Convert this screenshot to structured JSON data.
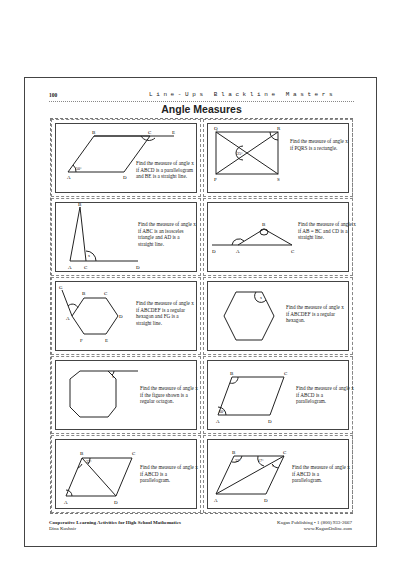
{
  "header": {
    "page_number": "100",
    "series_title": "Line-Ups Blackline Masters",
    "title": "Angle Measures"
  },
  "problems": [
    {
      "id": 1,
      "prompt": "Find the measure of angle x if ABCD is a parallelogram and BE is a straight line.",
      "labels": [
        "A",
        "B",
        "C",
        "D",
        "E"
      ],
      "given": "50°"
    },
    {
      "id": 2,
      "prompt": "Find the measure of angle x if PQRS is a rectangle.",
      "labels": [
        "P",
        "Q",
        "R",
        "S"
      ],
      "given": "25°"
    },
    {
      "id": 3,
      "prompt": "Find the measure of angle x if ABC is an isosceles triangle and AD is a straight line.",
      "labels": [
        "A",
        "B",
        "C",
        "D"
      ],
      "given": "x"
    },
    {
      "id": 4,
      "prompt": "Find the measure of angle x if AB = BC and CD is a straight line.",
      "labels": [
        "A",
        "B",
        "C",
        "D"
      ],
      "given": "x"
    },
    {
      "id": 5,
      "prompt": "Find the measure of angle x if ABCDEF is a regular hexagon and FG is a straight line.",
      "labels": [
        "A",
        "B",
        "C",
        "D",
        "E",
        "F",
        "G"
      ],
      "given": "x"
    },
    {
      "id": 6,
      "prompt": "Find the measure of angle x if ABCDEF is a regular hexagon.",
      "labels": [],
      "given": "x"
    },
    {
      "id": 7,
      "prompt": "Find the measure of angle x if the figure shown is a regular octagon.",
      "labels": [],
      "given": "x"
    },
    {
      "id": 8,
      "prompt": "Find the measure of angle x if ABCD is a parallelogram.",
      "labels": [
        "A",
        "B",
        "C",
        "D"
      ],
      "given": "60°"
    },
    {
      "id": 9,
      "prompt": "Find the measure of angle x if ABCD is a parallelogram.",
      "labels": [
        "A",
        "B",
        "C",
        "D"
      ],
      "given": "32°"
    },
    {
      "id": 10,
      "prompt": "Find the measure of angle x if ABCD is a parallelogram.",
      "labels": [
        "A",
        "B",
        "C",
        "D"
      ],
      "given": "17°"
    }
  ],
  "footer": {
    "book_title": "Cooperative Learning Activities for High School Mathematics",
    "author": "Dina Kushnir",
    "publisher": "Kagan Publishing • 1 (800) 933-2667",
    "website": "www.KaganOnline.com"
  }
}
